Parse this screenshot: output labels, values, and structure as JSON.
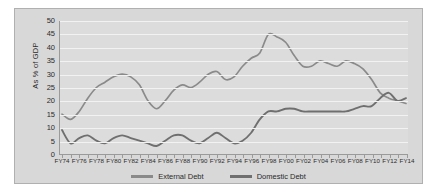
{
  "chart_data": {
    "type": "line",
    "title": "",
    "xlabel": "",
    "ylabel": "As % of GDP",
    "ylim": [
      0,
      50
    ],
    "ytick_step": 5,
    "yticks": [
      50,
      45,
      40,
      35,
      30,
      25,
      20,
      15,
      10,
      5,
      0
    ],
    "grid": true,
    "legend_position": "bottom",
    "x": [
      "FY74",
      "FY75",
      "FY76",
      "FY77",
      "FY78",
      "FY79",
      "FY80",
      "FY81",
      "FY82",
      "FY83",
      "FY84",
      "FY85",
      "FY86",
      "FY87",
      "FY88",
      "FY89",
      "FY90",
      "FY91",
      "FY92",
      "FY93",
      "FY94",
      "FY95",
      "FY96",
      "FY97",
      "FY98",
      "FY99",
      "FY00",
      "FY01",
      "FY02",
      "FY03",
      "FY04",
      "FY05",
      "FY06",
      "FY07",
      "FY08",
      "FY09",
      "FY10",
      "FY11",
      "FY12",
      "FY13",
      "FY14"
    ],
    "xtick_labels": [
      "FY74",
      "FY76",
      "FY78",
      "FY80",
      "FY82",
      "FY84",
      "FY86",
      "FY88",
      "FY90",
      "FY92",
      "FY94",
      "FY96",
      "FY98",
      "FY00",
      "FY02",
      "FY04",
      "FY06",
      "FY08",
      "FY10",
      "FY12",
      "FY14"
    ],
    "series": [
      {
        "name": "External Debt",
        "color": "#8a8a8a",
        "values": [
          15,
          13,
          16,
          21,
          25,
          27,
          29,
          30,
          29,
          26,
          20,
          17,
          20,
          24,
          26,
          25,
          27,
          30,
          31,
          28,
          29,
          33,
          36,
          38,
          45,
          44,
          42,
          37,
          33,
          33,
          35,
          34,
          33,
          35,
          34,
          32,
          28,
          23,
          21,
          20,
          19
        ]
      },
      {
        "name": "Domestic Debt",
        "color": "#6f6f6f",
        "values": [
          9,
          4,
          6,
          7,
          5,
          4,
          6,
          7,
          6,
          5,
          4,
          3,
          5,
          7,
          7,
          5,
          4,
          6,
          8,
          6,
          4,
          5,
          8,
          13,
          16,
          16,
          17,
          17,
          16,
          16,
          16,
          16,
          16,
          16,
          17,
          18,
          18,
          21,
          23,
          20,
          21
        ]
      }
    ]
  },
  "legend": {
    "items": [
      {
        "label": "External Debt"
      },
      {
        "label": "Domestic Debt"
      }
    ]
  }
}
